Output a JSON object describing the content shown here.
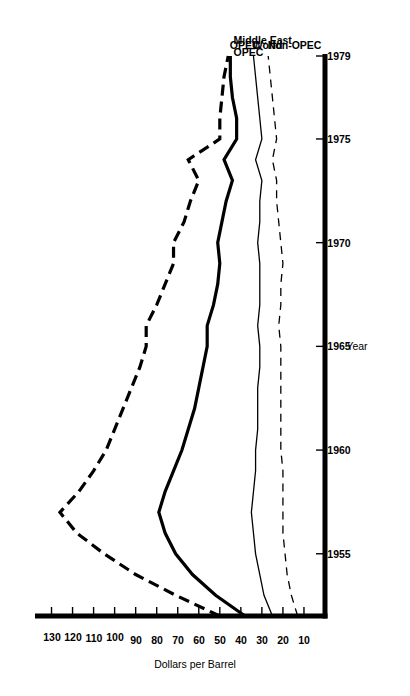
{
  "chart_data": {
    "type": "line",
    "title": "",
    "xlabel": "Year",
    "ylabel": "Dollars per Barrel",
    "orientation": "rotated-90-ccw",
    "grid": false,
    "legend_position": "inline-right-of-curves",
    "xlim": [
      1952,
      1979
    ],
    "ylim": [
      0,
      135
    ],
    "x_ticks": [
      1955,
      1960,
      1965,
      1970,
      1975,
      1979
    ],
    "x_tick_labels": [
      "1955",
      "1960",
      "1965",
      "1970",
      "1975",
      "1979"
    ],
    "y_ticks": [
      10,
      20,
      30,
      40,
      50,
      60,
      70,
      80,
      90,
      100,
      110,
      120,
      130
    ],
    "y_tick_labels": [
      "10",
      "20",
      "30",
      "40",
      "50",
      "60",
      "70",
      "80",
      "90",
      "100",
      "110",
      "120",
      "130"
    ],
    "x": [
      1952,
      1953,
      1954,
      1955,
      1956,
      1957,
      1958,
      1959,
      1960,
      1961,
      1962,
      1963,
      1964,
      1965,
      1966,
      1967,
      1968,
      1969,
      1970,
      1971,
      1972,
      1973,
      1974,
      1975,
      1976,
      1977,
      1978,
      1979
    ],
    "series": [
      {
        "name": "Middle East OPEC",
        "label_lines": [
          "Middle East",
          "OPEC"
        ],
        "style": "dashed",
        "width": "thick",
        "color": "#000000",
        "values": [
          50,
          71,
          90,
          105,
          118,
          126,
          117,
          110,
          104,
          100,
          96,
          92,
          88,
          85,
          85,
          80,
          76,
          72,
          72,
          67,
          64,
          60,
          65,
          50,
          50,
          49,
          48,
          46
        ]
      },
      {
        "name": "OPEC",
        "label_lines": [
          "OPEC"
        ],
        "style": "solid",
        "width": "thick",
        "color": "#000000",
        "values": [
          38,
          52,
          63,
          71,
          76,
          79,
          76,
          72,
          68,
          65,
          62,
          60,
          58,
          56,
          56,
          53,
          51,
          50,
          51,
          49,
          47,
          44,
          48,
          42,
          42,
          44,
          45,
          45
        ]
      },
      {
        "name": "World",
        "label_lines": [
          "World"
        ],
        "style": "solid",
        "width": "thin",
        "color": "#000000",
        "values": [
          25,
          29,
          31,
          33,
          34,
          35,
          34,
          33,
          33,
          32,
          32,
          32,
          31,
          31,
          32,
          31,
          31,
          31,
          32,
          31,
          31,
          30,
          33,
          30,
          31,
          32,
          33,
          34
        ]
      },
      {
        "name": "Non-OPEC",
        "label_lines": [
          "Non-OPEC"
        ],
        "style": "dashed",
        "width": "thin",
        "color": "#000000",
        "values": [
          13,
          16,
          18,
          19,
          20,
          20,
          20,
          20,
          21,
          21,
          21,
          21,
          21,
          21,
          22,
          21,
          21,
          20,
          21,
          22,
          23,
          23,
          25,
          23,
          24,
          25,
          26,
          27
        ]
      }
    ]
  }
}
